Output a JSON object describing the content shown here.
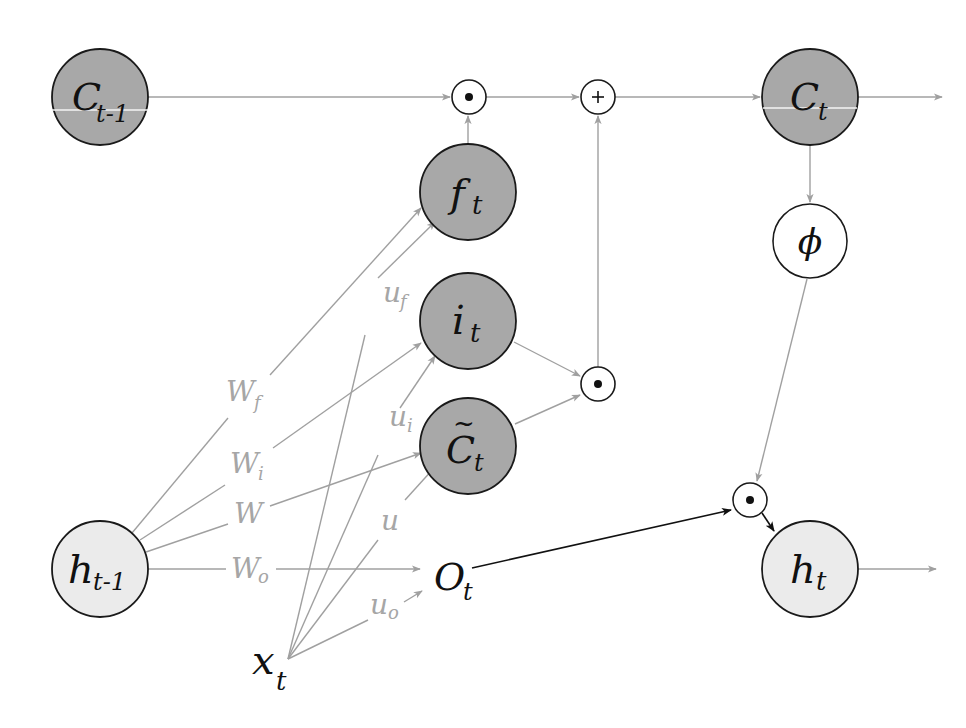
{
  "diagram": {
    "type": "lstm-cell",
    "colors": {
      "gate_fill": "#a8a8a8",
      "state_light_fill": "#ebebeb",
      "op_fill": "#ffffff",
      "outline": "#1a1a1a",
      "edge_gray": "#a0a0a0",
      "edge_black": "#111111",
      "weight_label": "#a6a6a6"
    },
    "nodes": {
      "c_prev": {
        "main": "C",
        "sub": "t-1"
      },
      "c_t": {
        "main": "C",
        "sub": "t"
      },
      "f_t": {
        "main": "f",
        "sub": "t"
      },
      "i_t": {
        "main": "i",
        "sub": "t"
      },
      "c_tilde": {
        "main": "C",
        "sub": "t",
        "accent": "~"
      },
      "phi": {
        "main": "ϕ"
      },
      "h_prev": {
        "main": "h",
        "sub": "t-1"
      },
      "h_t": {
        "main": "h",
        "sub": "t"
      },
      "o_t": {
        "main": "O",
        "sub": "t"
      },
      "x_t": {
        "main": "x",
        "sub": "t"
      },
      "mul_top": {
        "symbol": "•"
      },
      "add_top": {
        "symbol": "+"
      },
      "mul_mid": {
        "symbol": "•"
      },
      "mul_out": {
        "symbol": "•"
      }
    },
    "weights": {
      "w_f": {
        "main": "W",
        "sub": "f"
      },
      "w_i": {
        "main": "W",
        "sub": "i"
      },
      "w": {
        "main": "W",
        "sub": ""
      },
      "w_o": {
        "main": "W",
        "sub": "o"
      },
      "u_f": {
        "main": "u",
        "sub": "f"
      },
      "u_i": {
        "main": "u",
        "sub": "i"
      },
      "u": {
        "main": "u",
        "sub": ""
      },
      "u_o": {
        "main": "u",
        "sub": "o"
      }
    }
  }
}
